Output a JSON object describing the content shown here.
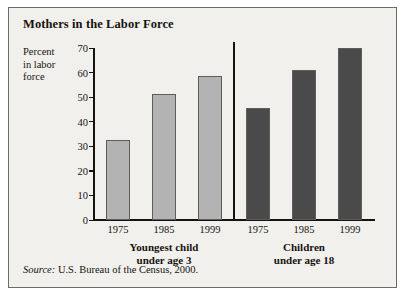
{
  "card": {
    "title": "Mothers in the Labor Force",
    "source_label": "Source:",
    "source_text": " U.S. Bureau of the Census, 2000."
  },
  "chart_data": {
    "type": "bar",
    "title": "Mothers in the Labor Force",
    "xlabel": "",
    "ylabel": "Percent in labor force",
    "ylim": [
      0,
      70
    ],
    "yticks": [
      0,
      10,
      20,
      30,
      40,
      50,
      60,
      70
    ],
    "ytick_labels": [
      "0",
      "10",
      "20",
      "30",
      "40",
      "50",
      "60",
      "70"
    ],
    "grid": false,
    "legend": "none",
    "groups": [
      {
        "name": "Youngest child under age 3",
        "label_line1": "Youngest child",
        "label_line2": "under age 3",
        "color": "#b3b3b3",
        "categories": [
          "1975",
          "1985",
          "1999"
        ],
        "values": [
          32.5,
          51,
          58.5
        ]
      },
      {
        "name": "Children under age 18",
        "label_line1": "Children",
        "label_line2": "under age 18",
        "color": "#4a4a4a",
        "categories": [
          "1975",
          "1985",
          "1999"
        ],
        "values": [
          45.5,
          61,
          70
        ]
      }
    ]
  }
}
